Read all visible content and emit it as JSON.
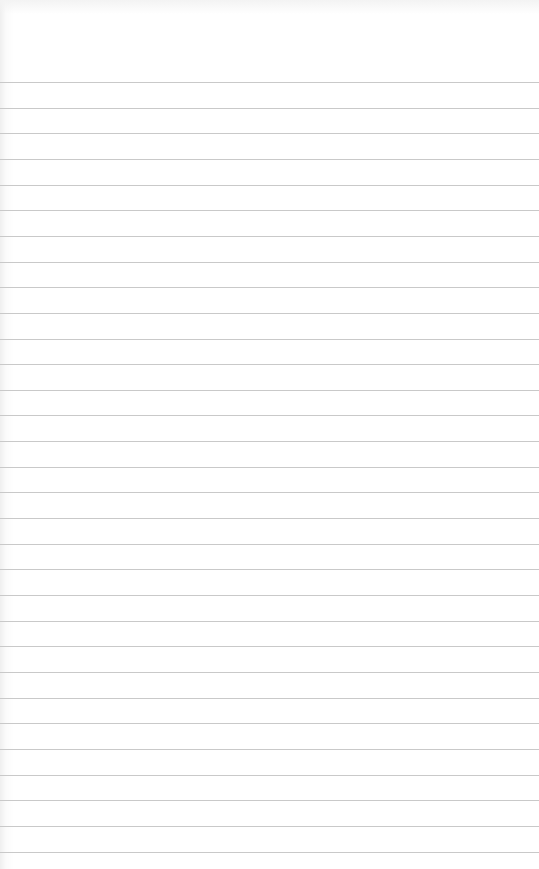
{
  "page": {
    "type": "blank ruled notebook paper",
    "rule_count": 31,
    "colors": {
      "paper": "#ffffff",
      "rule": "#c9c9c9"
    }
  }
}
